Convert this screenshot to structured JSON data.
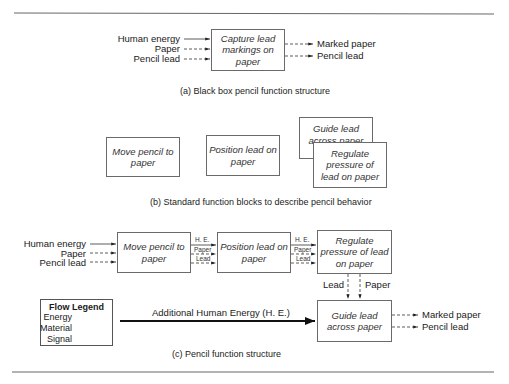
{
  "part_a": {
    "caption": "(a) Black box pencil function structure",
    "box": "Capture lead markings on paper",
    "inputs": [
      "Human energy",
      "Paper",
      "Pencil lead"
    ],
    "outputs": [
      "Marked paper",
      "Pencil lead"
    ]
  },
  "part_b": {
    "caption": "(b) Standard function blocks to describe pencil behavior",
    "boxes": [
      "Move pencil to paper",
      "Position lead on paper",
      "Guide lead across paper",
      "Regulate pressure of lead on paper"
    ]
  },
  "part_c": {
    "caption": "(c) Pencil function structure",
    "inputs": [
      "Human energy",
      "Paper",
      "Pencil lead"
    ],
    "boxes": [
      "Move pencil to paper",
      "Position lead on paper",
      "Regulate pressure of lead on paper",
      "Guide lead across paper"
    ],
    "connector_labels": [
      "H. E.",
      "Paper",
      "Lead"
    ],
    "vertical_labels": [
      "Lead",
      "Paper"
    ],
    "additional_energy": "Additional Human Energy (H. E.)",
    "outputs": [
      "Marked paper",
      "Pencil lead"
    ],
    "legend": {
      "title": "Flow Legend",
      "items": [
        "Energy",
        "Material",
        "Signal"
      ]
    }
  }
}
